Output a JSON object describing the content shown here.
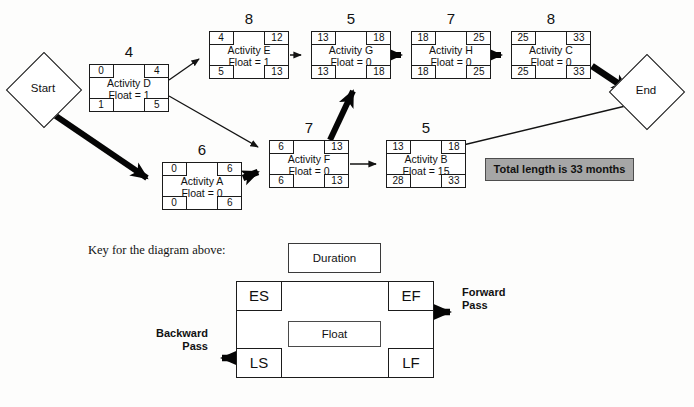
{
  "diagram": {
    "title_badge": "Total length is 33 months",
    "start_node": {
      "label": "Start"
    },
    "end_node": {
      "label": "End"
    },
    "nodes": [
      {
        "id": "D",
        "name": "Activity D",
        "float_label": "Float = 1",
        "duration": "4",
        "es": "0",
        "ef": "4",
        "ls": "1",
        "lf": "5",
        "x": 89,
        "y": 64
      },
      {
        "id": "E",
        "name": "Activity E",
        "float_label": "Float = 1",
        "duration": "8",
        "es": "4",
        "ef": "12",
        "ls": "5",
        "lf": "13",
        "x": 209,
        "y": 31
      },
      {
        "id": "G",
        "name": "Activity G",
        "float_label": "Float = 0",
        "duration": "5",
        "es": "13",
        "ef": "18",
        "ls": "13",
        "lf": "18",
        "x": 311,
        "y": 31
      },
      {
        "id": "H",
        "name": "Activity H",
        "float_label": "Float = 0",
        "duration": "7",
        "es": "18",
        "ef": "25",
        "ls": "18",
        "lf": "25",
        "x": 411,
        "y": 31
      },
      {
        "id": "C",
        "name": "Activity C",
        "float_label": "Float = 0",
        "duration": "8",
        "es": "25",
        "ef": "33",
        "ls": "25",
        "lf": "33",
        "x": 511,
        "y": 31
      },
      {
        "id": "A",
        "name": "Activity A",
        "float_label": "Float = 0",
        "duration": "6",
        "es": "0",
        "ef": "6",
        "ls": "0",
        "lf": "6",
        "x": 162,
        "y": 162
      },
      {
        "id": "F",
        "name": "Activity F",
        "float_label": "Float = 0",
        "duration": "7",
        "es": "6",
        "ef": "13",
        "ls": "6",
        "lf": "13",
        "x": 269,
        "y": 140
      },
      {
        "id": "B",
        "name": "Activity B",
        "float_label": "Float = 15",
        "duration": "5",
        "es": "13",
        "ef": "18",
        "ls": "28",
        "lf": "33",
        "x": 386,
        "y": 140
      }
    ]
  },
  "key": {
    "caption": "Key for the diagram above:",
    "duration_label": "Duration",
    "es_label": "ES",
    "ef_label": "EF",
    "ls_label": "LS",
    "lf_label": "LF",
    "float_label": "Float",
    "forward_pass_line1": "Forward",
    "forward_pass_line2": "Pass",
    "backward_pass_line1": "Backward",
    "backward_pass_line2": "Pass"
  },
  "colors": {
    "stroke": "#1b1b1b",
    "badge_fill": "#a6a6a6",
    "page_bg": "#fdfdfc"
  }
}
